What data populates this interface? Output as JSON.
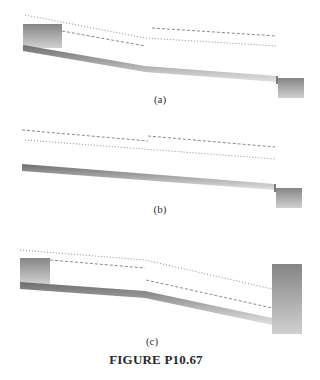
{
  "top_clip_text": "",
  "figure": {
    "caption": "FIGURE P10.67",
    "panels": [
      {
        "id": "a",
        "label": "(a)",
        "description": "Open-channel profile: upstream reservoir, steeper slope then milder slope, drop to downstream reservoir",
        "line_styles": [
          "dotted",
          "dashed"
        ]
      },
      {
        "id": "b",
        "label": "(b)",
        "description": "Open-channel profile: single uniform slope ending in free fall to low downstream reservoir",
        "line_styles": [
          "dashed",
          "dotted"
        ]
      },
      {
        "id": "c",
        "label": "(c)",
        "description": "Open-channel profile: upstream reservoir, mild slope then steeper slope into high downstream reservoir",
        "line_styles": [
          "dotted",
          "dashed"
        ]
      }
    ]
  },
  "colors": {
    "channel_dark": "#6e6e6e",
    "channel_light": "#d8d8d8",
    "reservoir_dark": "#8c8c8c",
    "reservoir_light": "#cfcfcf",
    "line": "#8a8a8a",
    "text": "#333333"
  }
}
